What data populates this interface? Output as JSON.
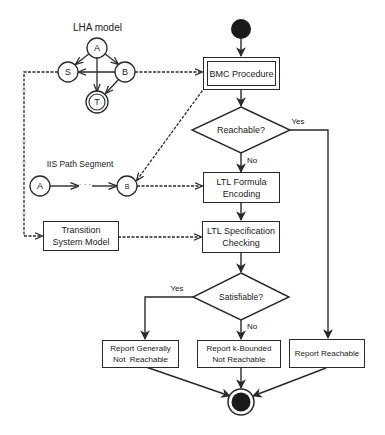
{
  "lha": {
    "title": "LHA model",
    "states": {
      "a": "A",
      "s": "S",
      "b": "B",
      "t": "T"
    }
  },
  "iis": {
    "title": "IIS Path Segment",
    "start": "A",
    "ellipsis": "· · ·",
    "end": "B"
  },
  "transition_system": {
    "line1": "Transition",
    "line2": "System Model"
  },
  "flow": {
    "bmc": "BMC Procedure",
    "reachable": "Reachable?",
    "reachable_yes": "Yes",
    "reachable_no": "No",
    "ltl_formula": {
      "line1": "LTL Formula",
      "line2": "Encoding"
    },
    "ltl_spec": {
      "line1": "LTL Specification",
      "line2": "Checking"
    },
    "satisfiable": "Satisfiable?",
    "satisfiable_yes": "Yes",
    "satisfiable_no": "No",
    "report_general": {
      "line1": "Report Generally",
      "line2": "Not  Reachable"
    },
    "report_kbounded": {
      "line1": "Report k-Bounded",
      "line2": "Not Reachable"
    },
    "report_reachable": "Report Reachable"
  },
  "colors": {
    "stroke": "#2a2a2a",
    "fill_dark": "#1a1a1a",
    "background": "#ffffff"
  }
}
